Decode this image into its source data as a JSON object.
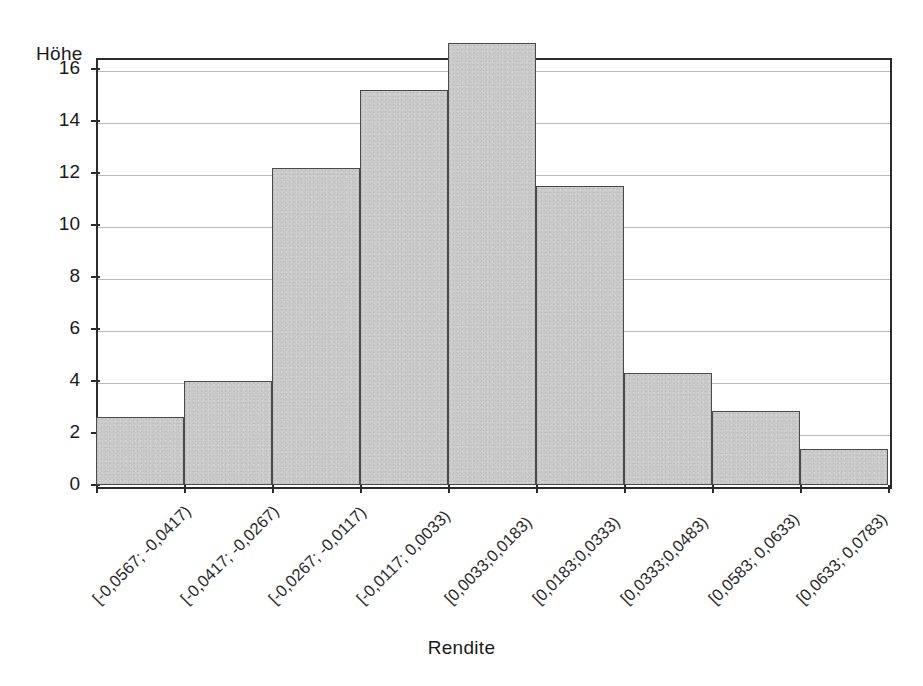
{
  "chart_data": {
    "type": "bar",
    "title": "",
    "subtitle": "",
    "xlabel": "Rendite",
    "ylabel": "Höhe",
    "ylim": [
      0,
      18
    ],
    "y_ticks": [
      0,
      2,
      4,
      6,
      8,
      10,
      12,
      14,
      16
    ],
    "y_tick_labels": [
      "0",
      "2",
      "4",
      "6",
      "8",
      "10",
      "12",
      "14",
      "16"
    ],
    "grid": true,
    "legend": null,
    "categories": [
      "[-0,0567; -0,0417)",
      "[-0,0417; -0,0267)",
      "[-0,0267; -0,0117)",
      "[-0,0117; 0,0033)",
      "[0,0033;0,0183)",
      "[0,0183;0,0333)",
      "[0,0333;0,0483)",
      "[0,0583; 0,0633)",
      "[0,0633; 0,0783)"
    ],
    "values": [
      2.6,
      4.0,
      12.2,
      15.2,
      17.0,
      11.5,
      4.3,
      2.85,
      1.4
    ],
    "bar_fill_color": "#cbcbcb",
    "bar_edge_color": "#4a4a4a",
    "axis_color": "#2b2b2b",
    "grid_color": "#b9b9b9"
  }
}
